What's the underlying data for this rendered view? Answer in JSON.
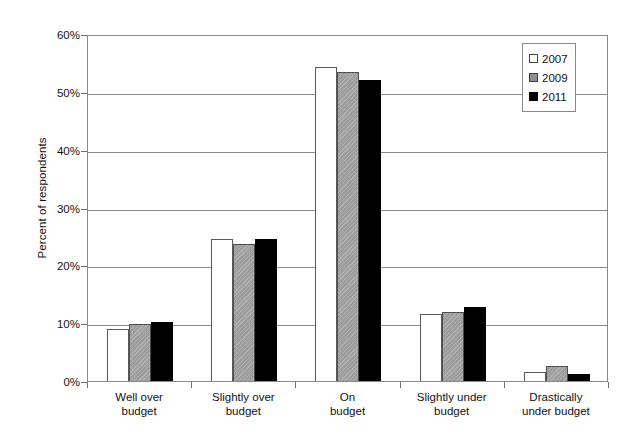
{
  "chart_data": {
    "type": "bar",
    "title": "",
    "xlabel": "",
    "ylabel": "Percent of respondents",
    "ylim": [
      0,
      60
    ],
    "ytick_labels": [
      "0%",
      "10%",
      "20%",
      "30%",
      "40%",
      "50%",
      "60%"
    ],
    "ytick_values": [
      0,
      10,
      20,
      30,
      40,
      50,
      60
    ],
    "grid": true,
    "legend_position": "top-right",
    "categories": [
      "Well over budget",
      "Slightly over budget",
      "On budget",
      "Slightly under budget",
      "Drastically under budget"
    ],
    "category_lines": [
      [
        "Well over",
        "budget"
      ],
      [
        "Slightly over",
        "budget"
      ],
      [
        "On",
        "budget"
      ],
      [
        "Slightly under",
        "budget"
      ],
      [
        "Drastically",
        "under budget"
      ]
    ],
    "series": [
      {
        "name": "2007",
        "color": "#ffffff",
        "values": [
          9.0,
          24.5,
          54.3,
          11.6,
          1.6
        ]
      },
      {
        "name": "2009",
        "color": "#9c9c9c",
        "values": [
          9.8,
          23.7,
          53.5,
          11.9,
          2.6
        ]
      },
      {
        "name": "2011",
        "color": "#000000",
        "values": [
          10.2,
          24.5,
          52.0,
          12.8,
          1.2
        ]
      }
    ]
  },
  "legend": {
    "items": [
      {
        "label": "2007"
      },
      {
        "label": "2009"
      },
      {
        "label": "2011"
      }
    ]
  }
}
